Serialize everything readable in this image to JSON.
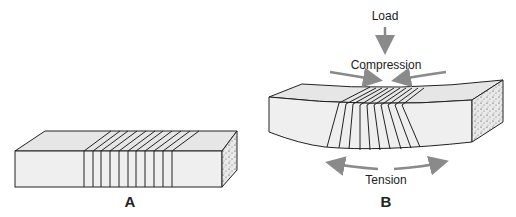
{
  "figure": {
    "panels": [
      {
        "id": "A",
        "label": "A",
        "description": "Unloaded rectangular beam with evenly spaced parallel lines"
      },
      {
        "id": "B",
        "label": "B",
        "description": "Beam bent under load; lines converge at top and spread at bottom"
      }
    ],
    "annotations": {
      "load": "Load",
      "compression": "Compression",
      "tension": "Tension"
    },
    "colors": {
      "arrow": "#8a8a8a",
      "beam_face": "#efefef",
      "beam_top": "#e6e6e6",
      "outline": "#222222"
    }
  }
}
